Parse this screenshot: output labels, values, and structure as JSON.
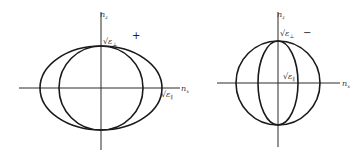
{
  "diagrams": [
    {
      "id": "positive-crystal",
      "sign": "+",
      "axis_vertical_label": "n_z",
      "axis_horizontal_label": "n_x",
      "vertical_axis_label_main": "n",
      "vertical_axis_label_sub": "z",
      "horizontal_axis_label_main": "n",
      "horizontal_axis_label_sub": "x",
      "intercept_perp_label": "√ε",
      "intercept_perp_sub": "⊥",
      "intercept_par_label": "√ε",
      "intercept_par_sub": "∥",
      "curves": [
        {
          "name": "ellipse",
          "semi_axis_x": "√ε∥",
          "semi_axis_z": "√ε⊥"
        },
        {
          "name": "circle",
          "radius": "√ε⊥"
        }
      ]
    },
    {
      "id": "negative-crystal",
      "sign": "−",
      "axis_vertical_label": "n_z",
      "axis_horizontal_label": "n_x",
      "vertical_axis_label_main": "n",
      "vertical_axis_label_sub": "z",
      "horizontal_axis_label_main": "n",
      "horizontal_axis_label_sub": "x",
      "intercept_perp_label": "√ε",
      "intercept_perp_sub": "⊥",
      "intercept_par_label": "√ε",
      "intercept_par_sub": "∥",
      "curves": [
        {
          "name": "circle",
          "radius": "√ε⊥"
        },
        {
          "name": "ellipse",
          "semi_axis_x": "√ε∥",
          "semi_axis_z": "√ε⊥"
        }
      ]
    }
  ]
}
